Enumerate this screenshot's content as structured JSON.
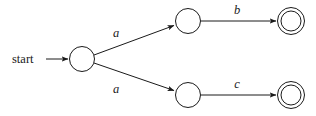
{
  "figure": {
    "type": "finite-automaton-state-diagram",
    "width": 316,
    "height": 116,
    "background_color": "#ffffff",
    "stroke_color": "#1a1a1a"
  },
  "start_marker": {
    "label": "start",
    "x": 12,
    "y": 63,
    "arrow_from_x": 46,
    "arrow_to_x": 68,
    "arrow_y": 59
  },
  "states": [
    {
      "id": "q0",
      "name": "start-state",
      "label": "",
      "cx": 82,
      "cy": 59,
      "r": 13,
      "accepting": false
    },
    {
      "id": "q1",
      "name": "upper-middle-state",
      "label": "",
      "cx": 188,
      "cy": 21,
      "r": 13,
      "accepting": false
    },
    {
      "id": "q2",
      "name": "lower-middle-state",
      "label": "",
      "cx": 188,
      "cy": 95,
      "r": 13,
      "accepting": false
    },
    {
      "id": "q3",
      "name": "upper-accepting-state",
      "label": "",
      "cx": 291,
      "cy": 21,
      "r": 14,
      "inner_r": 10.5,
      "accepting": true
    },
    {
      "id": "q4",
      "name": "lower-accepting-state",
      "label": "",
      "cx": 291,
      "cy": 95,
      "r": 14,
      "inner_r": 10.5,
      "accepting": true
    }
  ],
  "transitions": [
    {
      "id": "t0",
      "name": "transition-q0-q1",
      "from": "q0",
      "to": "q1",
      "symbol": "a",
      "label_x": 119,
      "label_y": 36,
      "x1": 94,
      "y1": 55,
      "x2": 174,
      "y2": 25
    },
    {
      "id": "t1",
      "name": "transition-q0-q2",
      "from": "q0",
      "to": "q2",
      "symbol": "a",
      "label_x": 119,
      "label_y": 92,
      "x1": 94,
      "y1": 63,
      "x2": 174,
      "y2": 91
    },
    {
      "id": "t2",
      "name": "transition-q1-q3",
      "from": "q1",
      "to": "q3",
      "symbol": "b",
      "label_x": 236,
      "label_y": 13,
      "x1": 201,
      "y1": 21,
      "x2": 275,
      "y2": 21
    },
    {
      "id": "t3",
      "name": "transition-q2-q4",
      "from": "q2",
      "to": "q4",
      "symbol": "c",
      "label_x": 236,
      "label_y": 87,
      "x1": 201,
      "y1": 95,
      "x2": 275,
      "y2": 95
    }
  ],
  "alphabet": [
    "a",
    "b",
    "c"
  ]
}
